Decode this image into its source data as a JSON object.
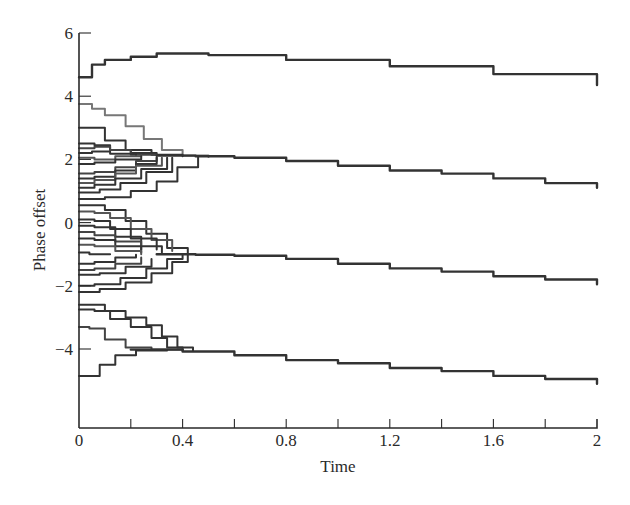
{
  "chart_data": {
    "type": "line",
    "title": "",
    "xlabel": "Time",
    "ylabel": "Phase offset",
    "xlim": [
      0,
      2
    ],
    "ylim": [
      -6.6,
      6
    ],
    "grid": false,
    "legend": null,
    "x_ticks": [
      0,
      0.2,
      0.4,
      0.6,
      0.8,
      1.0,
      1.2,
      1.4,
      1.6,
      1.8,
      2.0
    ],
    "x_tick_labels": [
      "0",
      "",
      "0.4",
      "",
      "0.8",
      "",
      "1.2",
      "",
      "1.6",
      "",
      "2"
    ],
    "y_ticks": [
      6,
      4,
      2,
      0,
      -2,
      -4
    ],
    "y_tick_labels": [
      "6",
      "4",
      "2",
      "0",
      "−2",
      "−4"
    ],
    "clusters": [
      {
        "name": "cluster-1",
        "converged_value_start": 5.3,
        "end_value_at_t2": 4.3
      },
      {
        "name": "cluster-2",
        "converged_value_start": 2.1,
        "merge_time": 0.45,
        "end_value_at_t2": 1.1
      },
      {
        "name": "cluster-3",
        "converged_value_start": -1.0,
        "merge_time": 0.4,
        "end_value_at_t2": -1.9
      },
      {
        "name": "cluster-4",
        "converged_value_start": -4.0,
        "merge_time": 0.4,
        "end_value_at_t2": -5.1
      }
    ],
    "series": [
      {
        "name": "top",
        "color": "#333333",
        "points": [
          [
            0,
            4.6
          ],
          [
            0.02,
            4.6
          ],
          [
            0.05,
            5.0
          ],
          [
            0.1,
            5.15
          ],
          [
            0.2,
            5.25
          ],
          [
            0.3,
            5.35
          ],
          [
            0.5,
            5.3
          ],
          [
            0.8,
            5.15
          ],
          [
            1.2,
            4.95
          ],
          [
            1.6,
            4.7
          ],
          [
            2,
            4.35
          ]
        ]
      },
      {
        "name": "c2-a",
        "color": "#777777",
        "points": [
          [
            0,
            3.75
          ],
          [
            0.05,
            3.6
          ],
          [
            0.1,
            3.4
          ],
          [
            0.18,
            3.05
          ],
          [
            0.25,
            2.65
          ],
          [
            0.32,
            2.3
          ],
          [
            0.4,
            2.12
          ],
          [
            0.5,
            2.08
          ]
        ]
      },
      {
        "name": "c2-b",
        "color": "#333333",
        "points": [
          [
            0,
            3.0
          ],
          [
            0.04,
            3.0
          ],
          [
            0.1,
            2.6
          ],
          [
            0.18,
            2.3
          ],
          [
            0.28,
            2.15
          ],
          [
            0.4,
            2.1
          ]
        ]
      },
      {
        "name": "c2-c",
        "color": "#333333",
        "points": [
          [
            0,
            2.5
          ],
          [
            0.06,
            2.45
          ],
          [
            0.12,
            2.3
          ],
          [
            0.2,
            2.2
          ],
          [
            0.3,
            2.15
          ]
        ]
      },
      {
        "name": "c2-d",
        "color": "#444444",
        "points": [
          [
            0,
            2.35
          ],
          [
            0.06,
            2.4
          ],
          [
            0.12,
            2.3
          ],
          [
            0.2,
            2.15
          ],
          [
            0.3,
            2.12
          ]
        ]
      },
      {
        "name": "c2-e",
        "color": "#333333",
        "points": [
          [
            0,
            2.2
          ],
          [
            0.05,
            2.25
          ],
          [
            0.12,
            2.18
          ],
          [
            0.22,
            2.12
          ]
        ]
      },
      {
        "name": "c2-f",
        "color": "#555555",
        "points": [
          [
            0,
            2.05
          ],
          [
            0.06,
            2.0
          ],
          [
            0.14,
            2.1
          ],
          [
            0.24,
            2.12
          ]
        ]
      },
      {
        "name": "c2-g",
        "color": "#333333",
        "points": [
          [
            0,
            1.85
          ],
          [
            0.06,
            1.9
          ],
          [
            0.14,
            2.0
          ],
          [
            0.24,
            2.1
          ]
        ]
      },
      {
        "name": "c2-h",
        "color": "#444444",
        "points": [
          [
            0,
            1.55
          ],
          [
            0.06,
            1.6
          ],
          [
            0.14,
            1.75
          ],
          [
            0.22,
            1.95
          ],
          [
            0.3,
            2.08
          ]
        ]
      },
      {
        "name": "c2-i",
        "color": "#333333",
        "points": [
          [
            0,
            1.4
          ],
          [
            0.06,
            1.45
          ],
          [
            0.14,
            1.65
          ],
          [
            0.22,
            1.85
          ],
          [
            0.3,
            2.05
          ]
        ]
      },
      {
        "name": "c2-j",
        "color": "#555555",
        "points": [
          [
            0,
            1.25
          ],
          [
            0.06,
            1.35
          ],
          [
            0.14,
            1.55
          ],
          [
            0.22,
            1.8
          ],
          [
            0.32,
            2.05
          ]
        ]
      },
      {
        "name": "c2-k",
        "color": "#333333",
        "points": [
          [
            0,
            1.1
          ],
          [
            0.06,
            1.2
          ],
          [
            0.14,
            1.4
          ],
          [
            0.24,
            1.7
          ],
          [
            0.34,
            2.05
          ]
        ]
      },
      {
        "name": "c2-l",
        "color": "#333333",
        "points": [
          [
            0,
            0.95
          ],
          [
            0.08,
            1.05
          ],
          [
            0.16,
            1.25
          ],
          [
            0.26,
            1.6
          ],
          [
            0.36,
            2.05
          ]
        ]
      },
      {
        "name": "c2-m",
        "color": "#333333",
        "points": [
          [
            0,
            0.75
          ],
          [
            0.1,
            0.8
          ],
          [
            0.2,
            1.0
          ],
          [
            0.3,
            1.3
          ],
          [
            0.38,
            1.75
          ],
          [
            0.46,
            2.08
          ]
        ]
      },
      {
        "name": "c2-main",
        "color": "#333333",
        "points": [
          [
            0.3,
            2.12
          ],
          [
            0.45,
            2.1
          ],
          [
            0.6,
            2.05
          ],
          [
            0.8,
            1.95
          ],
          [
            1.0,
            1.8
          ],
          [
            1.2,
            1.65
          ],
          [
            1.4,
            1.55
          ],
          [
            1.6,
            1.4
          ],
          [
            1.8,
            1.25
          ],
          [
            2,
            1.1
          ]
        ]
      },
      {
        "name": "c3-a",
        "color": "#333333",
        "points": [
          [
            0,
            0.55
          ],
          [
            0.04,
            0.55
          ],
          [
            0.1,
            0.4
          ],
          [
            0.18,
            0.05
          ],
          [
            0.26,
            -0.35
          ],
          [
            0.34,
            -0.8
          ],
          [
            0.42,
            -1.0
          ]
        ]
      },
      {
        "name": "c3-b",
        "color": "#555555",
        "points": [
          [
            0,
            0.35
          ],
          [
            0.06,
            0.3
          ],
          [
            0.12,
            0.15
          ],
          [
            0.2,
            -0.2
          ],
          [
            0.28,
            -0.55
          ],
          [
            0.36,
            -0.9
          ]
        ]
      },
      {
        "name": "c3-c",
        "color": "#333333",
        "points": [
          [
            0,
            0.1
          ],
          [
            0.06,
            0.05
          ],
          [
            0.12,
            -0.2
          ],
          [
            0.2,
            -0.5
          ],
          [
            0.3,
            -0.85
          ]
        ]
      },
      {
        "name": "c3-d",
        "color": "#333333",
        "points": [
          [
            0,
            -0.1
          ],
          [
            0.06,
            -0.15
          ],
          [
            0.14,
            -0.45
          ],
          [
            0.24,
            -0.75
          ],
          [
            0.32,
            -0.95
          ]
        ]
      },
      {
        "name": "c3-e",
        "color": "#444444",
        "points": [
          [
            0,
            -0.3
          ],
          [
            0.06,
            -0.4
          ],
          [
            0.14,
            -0.6
          ],
          [
            0.24,
            -0.85
          ]
        ]
      },
      {
        "name": "c3-f",
        "color": "#333333",
        "points": [
          [
            0,
            -0.5
          ],
          [
            0.06,
            -0.55
          ],
          [
            0.14,
            -0.75
          ],
          [
            0.24,
            -0.95
          ]
        ]
      },
      {
        "name": "c3-g",
        "color": "#555555",
        "points": [
          [
            0,
            -0.7
          ],
          [
            0.06,
            -0.75
          ],
          [
            0.14,
            -0.9
          ],
          [
            0.24,
            -1.0
          ]
        ]
      },
      {
        "name": "c3-h",
        "color": "#333333",
        "points": [
          [
            0,
            -0.95
          ],
          [
            0.04,
            -1.0
          ],
          [
            0.12,
            -1.0
          ]
        ]
      },
      {
        "name": "c3-i",
        "color": "#333333",
        "points": [
          [
            0,
            -1.3
          ],
          [
            0.06,
            -1.25
          ],
          [
            0.14,
            -1.1
          ],
          [
            0.22,
            -1.02
          ]
        ]
      },
      {
        "name": "c3-j",
        "color": "#444444",
        "points": [
          [
            0,
            -1.5
          ],
          [
            0.06,
            -1.45
          ],
          [
            0.14,
            -1.3
          ],
          [
            0.24,
            -1.1
          ]
        ]
      },
      {
        "name": "c3-k",
        "color": "#333333",
        "points": [
          [
            0,
            -1.65
          ],
          [
            0.08,
            -1.6
          ],
          [
            0.18,
            -1.4
          ],
          [
            0.28,
            -1.15
          ]
        ]
      },
      {
        "name": "c3-l",
        "color": "#333333",
        "points": [
          [
            0,
            -2.0
          ],
          [
            0.06,
            -1.95
          ],
          [
            0.16,
            -1.75
          ],
          [
            0.26,
            -1.45
          ],
          [
            0.34,
            -1.15
          ],
          [
            0.4,
            -1.02
          ]
        ]
      },
      {
        "name": "c3-m",
        "color": "#333333",
        "points": [
          [
            0,
            -2.2
          ],
          [
            0.08,
            -2.1
          ],
          [
            0.18,
            -1.9
          ],
          [
            0.28,
            -1.6
          ],
          [
            0.36,
            -1.25
          ],
          [
            0.42,
            -1.02
          ]
        ]
      },
      {
        "name": "c3-main",
        "color": "#333333",
        "points": [
          [
            0.3,
            -1.0
          ],
          [
            0.45,
            -1.02
          ],
          [
            0.6,
            -1.05
          ],
          [
            0.8,
            -1.15
          ],
          [
            1.0,
            -1.3
          ],
          [
            1.2,
            -1.45
          ],
          [
            1.4,
            -1.55
          ],
          [
            1.6,
            -1.7
          ],
          [
            1.8,
            -1.8
          ],
          [
            2,
            -1.95
          ]
        ]
      },
      {
        "name": "c4-a",
        "color": "#333333",
        "points": [
          [
            0,
            -2.6
          ],
          [
            0.04,
            -2.6
          ],
          [
            0.1,
            -2.8
          ],
          [
            0.18,
            -3.0
          ],
          [
            0.26,
            -3.25
          ],
          [
            0.32,
            -3.6
          ],
          [
            0.38,
            -3.95
          ],
          [
            0.44,
            -4.05
          ]
        ]
      },
      {
        "name": "c4-b",
        "color": "#333333",
        "points": [
          [
            0,
            -2.75
          ],
          [
            0.06,
            -2.8
          ],
          [
            0.12,
            -3.05
          ],
          [
            0.2,
            -3.3
          ],
          [
            0.28,
            -3.65
          ],
          [
            0.34,
            -3.95
          ],
          [
            0.4,
            -4.05
          ]
        ]
      },
      {
        "name": "c4-c",
        "color": "#444444",
        "points": [
          [
            0,
            -3.3
          ],
          [
            0.04,
            -3.35
          ],
          [
            0.1,
            -3.7
          ],
          [
            0.18,
            -3.95
          ],
          [
            0.28,
            -4.02
          ],
          [
            0.4,
            -4.05
          ]
        ]
      },
      {
        "name": "c4-d",
        "color": "#333333",
        "points": [
          [
            0,
            -4.85
          ],
          [
            0.04,
            -4.85
          ],
          [
            0.08,
            -4.5
          ],
          [
            0.14,
            -4.2
          ],
          [
            0.22,
            -4.05
          ],
          [
            0.34,
            -4.03
          ]
        ]
      },
      {
        "name": "c4-main",
        "color": "#333333",
        "points": [
          [
            0.2,
            -4.02
          ],
          [
            0.4,
            -4.08
          ],
          [
            0.6,
            -4.2
          ],
          [
            0.8,
            -4.35
          ],
          [
            1.0,
            -4.45
          ],
          [
            1.2,
            -4.6
          ],
          [
            1.4,
            -4.7
          ],
          [
            1.6,
            -4.85
          ],
          [
            1.8,
            -4.95
          ],
          [
            2,
            -5.1
          ]
        ]
      }
    ]
  }
}
